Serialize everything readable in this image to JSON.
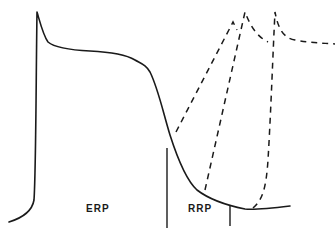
{
  "diagram": {
    "labels": {
      "erp": "ERP",
      "rrp": "RRP"
    },
    "colors": {
      "line": "#1a1a1a",
      "background": "#ffffff"
    },
    "elements": [
      {
        "name": "action-potential-trace",
        "style": "solid"
      },
      {
        "name": "erp-boundary-line",
        "style": "solid-vertical"
      },
      {
        "name": "rrp-boundary-line",
        "style": "solid-vertical"
      },
      {
        "name": "premature-response-1",
        "style": "dashed"
      },
      {
        "name": "premature-response-2",
        "style": "dashed"
      },
      {
        "name": "premature-response-3",
        "style": "dashed"
      }
    ]
  }
}
